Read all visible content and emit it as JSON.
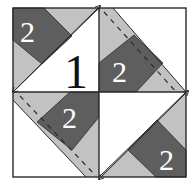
{
  "diagram": {
    "type": "quilt-block-piecing-diagram",
    "colors": {
      "dark": "#5e5e5e",
      "light": "#c2c2c2",
      "white": "#ffffff",
      "line": "#2a2a2a"
    },
    "labels": {
      "big_triangle": "1",
      "tl_strip": "2",
      "tr_strip": "2",
      "bl_strip": "2",
      "br_strip": "2"
    }
  }
}
